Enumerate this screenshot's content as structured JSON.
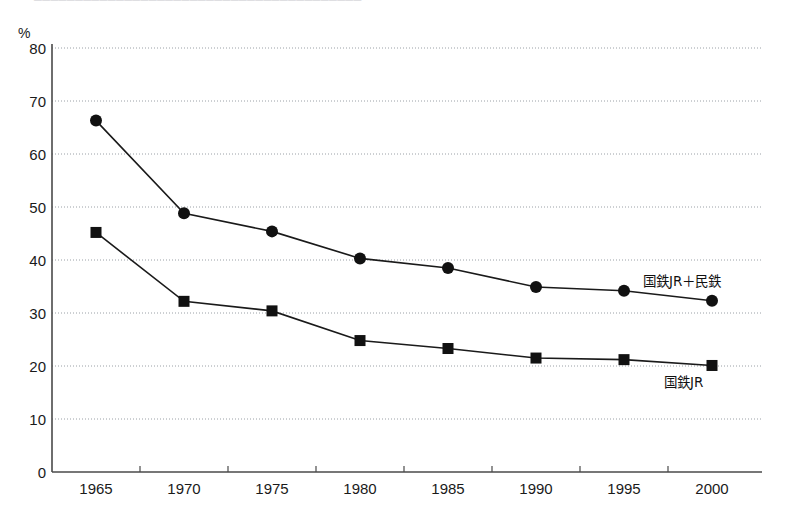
{
  "header": {
    "clipped_top_text": "────────────────────────────────────────"
  },
  "axis": {
    "y_unit": "%",
    "y_ticks": [
      "80",
      "70",
      "60",
      "50",
      "40",
      "30",
      "20",
      "10",
      "0"
    ],
    "x_ticks": [
      "1965",
      "1970",
      "1975",
      "1980",
      "1985",
      "1990",
      "1995",
      "2000"
    ]
  },
  "labels": {
    "series_rail_total": "国鉄JR＋民鉄",
    "series_jr": "国鉄JR"
  },
  "colors": {
    "line": "#1a1a1a",
    "marker": "#111111",
    "grid": "#9aa0a6",
    "axis": "#4a4a4a",
    "background": "#ffffff"
  },
  "chart_data": {
    "type": "line",
    "title": "",
    "xlabel": "",
    "ylabel": "%",
    "ylim": [
      0,
      80
    ],
    "ytick_step": 10,
    "grid": true,
    "legend_position": "inline-right",
    "categories": [
      "1965",
      "1970",
      "1975",
      "1980",
      "1985",
      "1990",
      "1995",
      "2000"
    ],
    "series": [
      {
        "name": "国鉄JR＋民鉄",
        "marker": "circle",
        "values": [
          66.3,
          48.8,
          45.4,
          40.3,
          38.5,
          34.9,
          34.2,
          32.3
        ]
      },
      {
        "name": "国鉄JR",
        "marker": "square",
        "values": [
          45.2,
          32.2,
          30.4,
          24.8,
          23.3,
          21.5,
          21.2,
          20.1
        ]
      }
    ]
  }
}
